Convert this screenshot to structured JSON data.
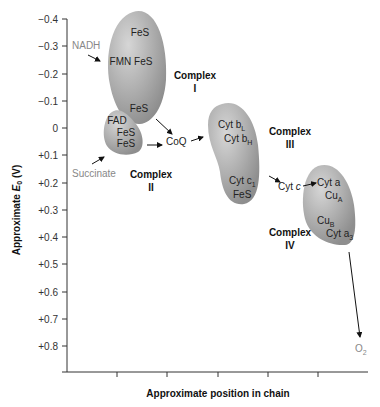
{
  "axes": {
    "y_label": "Approximate E′₀ (V)",
    "y_label_main": "Approximate ",
    "y_label_symbol": "E",
    "y_label_sub": "0",
    "y_label_unit": " (V)",
    "x_label": "Approximate position in chain",
    "y_ticks": [
      "−0.4",
      "−0.3",
      "−0.2",
      "−0.1",
      "0",
      "+0.1",
      "+0.2",
      "+0.3",
      "+0.4",
      "+0.5",
      "+0.6",
      "+0.7",
      "+0.8"
    ]
  },
  "complexes": {
    "c1": {
      "name": "Complex",
      "numeral": "I",
      "carriers": [
        "FeS",
        "FMN FeS",
        "FeS"
      ]
    },
    "c2": {
      "name": "Complex",
      "numeral": "II",
      "carriers": [
        "FAD",
        "FeS",
        "FeS"
      ]
    },
    "c3": {
      "name": "Complex",
      "numeral": "III",
      "carriers": [
        "Cyt b",
        "L",
        "Cyt b",
        "H",
        "Cyt c",
        "1",
        "FeS"
      ]
    },
    "c4": {
      "name": "Complex",
      "numeral": "IV",
      "carriers": [
        "Cyt a",
        "Cu",
        "A",
        "Cu",
        "B",
        "Cyt a",
        "3"
      ]
    }
  },
  "mobile": {
    "nadh": "NADH",
    "succinate": "Succinate",
    "coq": "CoQ",
    "cytc": "Cyt c",
    "cytc_italic": "c",
    "o2": "O",
    "o2_sub": "2"
  },
  "colors": {
    "blob_fill": "#a9a9a9",
    "blob_highlight": "#d4d4d4",
    "axis": "#333333",
    "grey_text": "#8a8a8a"
  }
}
